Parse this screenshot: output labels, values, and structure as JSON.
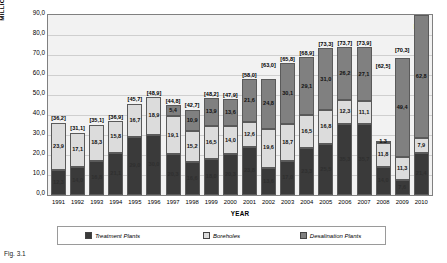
{
  "chart_data": {
    "type": "bar",
    "subtype": "stacked-column",
    "title": "",
    "xlabel": "YEAR",
    "ylabel": "MILLION CUBIC METRES OF WATER",
    "ylim": [
      0,
      90
    ],
    "ytick_step": 10,
    "ytick_labels": [
      "90,0",
      "80,0",
      "70,0",
      "60,0",
      "50,0",
      "40,0",
      "30,0",
      "20,0",
      "10,0",
      "0,0"
    ],
    "grid": true,
    "legend_position": "bottom",
    "decimal_separator": ",",
    "categories": [
      "1991",
      "1992",
      "1993",
      "1994",
      "1995",
      "1996",
      "1997",
      "1998",
      "1999",
      "2000",
      "2001",
      "2002",
      "2003",
      "2004",
      "2005",
      "2006",
      "2007",
      "2008",
      "2009",
      "2010"
    ],
    "series": [
      {
        "name": "Treatment Plants",
        "color": "#3a3a3a",
        "values": [
          12.3,
          14.0,
          16.8,
          21.1,
          29.0,
          30.0,
          20.3,
          16.6,
          18.0,
          20.3,
          23.8,
          13.6,
          17.0,
          23.3,
          25.5,
          35.3,
          35.7,
          14.0,
          7.6,
          21.4
        ],
        "labels": [
          "12,3",
          "14,0",
          "16,8",
          "21,1",
          "29,0",
          "30,0",
          "20,3",
          "16,6",
          "18,0",
          "20,3",
          "23,8",
          "13,6",
          "17,0",
          "23,3",
          "25,5",
          "35,3",
          "35,7",
          "14,0",
          "7,6",
          "21,4"
        ]
      },
      {
        "name": "Boreholes",
        "color": "#dcdcdc",
        "values": [
          23.9,
          17.1,
          18.3,
          15.8,
          16.7,
          18.9,
          19.1,
          15.2,
          16.5,
          14.0,
          12.6,
          19.6,
          18.7,
          16.5,
          16.8,
          12.3,
          11.1,
          11.8,
          11.3,
          7.9
        ],
        "labels": [
          "23,9",
          "17,1",
          "18,3",
          "15,8",
          "16,7",
          "18,9",
          "19,1",
          "15,2",
          "16,5",
          "14,0",
          "12,6",
          "19,6",
          "18,7",
          "16,5",
          "16,8",
          "12,3",
          "11,1",
          "11,8",
          "11,3",
          "7,9"
        ]
      },
      {
        "name": "Desalination Plants",
        "color": "#808080",
        "values": [
          0,
          0,
          0,
          0,
          0,
          0,
          5.4,
          10.9,
          13.9,
          13.6,
          21.6,
          24.8,
          30.1,
          29.1,
          31.0,
          26.2,
          27.1,
          1.3,
          49.4,
          62.8
        ],
        "labels": [
          "",
          "",
          "",
          "",
          "",
          "",
          "5,4",
          "10,9",
          "13,9",
          "13,6",
          "21,6",
          "24,8",
          "30,1",
          "29,1",
          "31,0",
          "26,2",
          "27,1",
          "1,3",
          "49,4",
          "62,8"
        ]
      }
    ],
    "totals": [
      36.2,
      31.1,
      35.1,
      36.9,
      45.7,
      48.9,
      44.8,
      42.7,
      48.2,
      47.9,
      58.0,
      63.0,
      65.8,
      68.9,
      73.3,
      73.7,
      73.9,
      62.5,
      70.3,
      82.1
    ],
    "total_labels": [
      "[36,2]",
      "[31,1]",
      "[35,1]",
      "[36,9]",
      "[45,7]",
      "[48,9]",
      "[44,8]",
      "[42,7]",
      "[48,2]",
      "[47,9]",
      "[58,0]",
      "[63,0]",
      "[65,8]",
      "[68,9]",
      "[73,3]",
      "[73,7]",
      "[73,9]",
      "[62,5]",
      "[70,3]",
      "[82,1]"
    ]
  },
  "caption": "Fig. 3.1"
}
